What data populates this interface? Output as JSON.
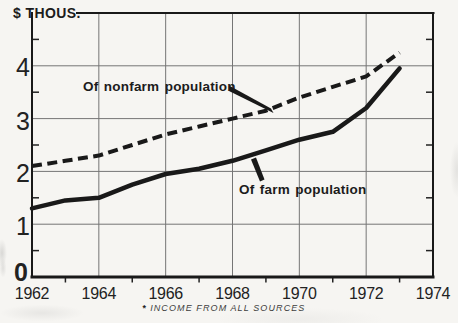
{
  "page": {
    "title": "$ THOUS.",
    "footnote_marker": "*",
    "footnote_text": "INCOME FROM ALL SOURCES"
  },
  "axes": {
    "y_labels": [
      "4",
      "3",
      "2",
      "1",
      "0"
    ],
    "x_labels": [
      "1962",
      "1964",
      "1966",
      "1968",
      "1970",
      "1972",
      "1974"
    ]
  },
  "series_labels": {
    "nonfarm": "Of nonfarm population",
    "farm": "Of farm population"
  },
  "colors": {
    "paper": "#f6f5f2",
    "ink": "#191919",
    "grid": "#757575",
    "text": "#1c1c1c"
  },
  "chart_data": {
    "type": "line",
    "title": "$ THOUS.",
    "ylabel": "$ THOUS.",
    "xlabel": "",
    "footnote": "* INCOME FROM ALL SOURCES",
    "xlim": [
      1962,
      1974
    ],
    "ylim": [
      0,
      5
    ],
    "x": [
      1962,
      1963,
      1964,
      1965,
      1966,
      1967,
      1968,
      1969,
      1970,
      1971,
      1972,
      1973
    ],
    "x_major_ticks": [
      1962,
      1964,
      1966,
      1968,
      1970,
      1972,
      1974
    ],
    "x_minor_tick_step": 1,
    "y_major_ticks": [
      0,
      1,
      2,
      3,
      4
    ],
    "y_minor_tick_step": 0.5,
    "grid": "major gridlines on, gray, boxed frame",
    "legend": "inline labels with leader lines",
    "series": [
      {
        "name": "Of nonfarm population",
        "line_style": "dashed",
        "color": "#191919",
        "values": [
          2.1,
          2.2,
          2.3,
          2.5,
          2.7,
          2.85,
          3.0,
          3.15,
          3.4,
          3.6,
          3.8,
          4.25
        ]
      },
      {
        "name": "Of farm population",
        "line_style": "solid",
        "color": "#191919",
        "values": [
          1.3,
          1.45,
          1.5,
          1.75,
          1.95,
          2.05,
          2.2,
          2.4,
          2.6,
          2.75,
          3.2,
          3.95
        ]
      }
    ]
  }
}
